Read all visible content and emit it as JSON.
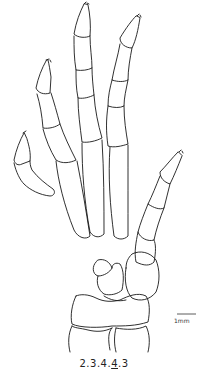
{
  "figure": {
    "phalangeal_formula": {
      "parts": [
        "2",
        ".",
        "3",
        ".",
        "4",
        ".",
        "4",
        ".",
        "3"
      ],
      "underlined_index": 6,
      "text": "2.3.4.4.3"
    },
    "scale_bar": {
      "label": "1mm"
    },
    "colors": {
      "line": "#1a1a1a",
      "background": "#ffffff"
    }
  }
}
